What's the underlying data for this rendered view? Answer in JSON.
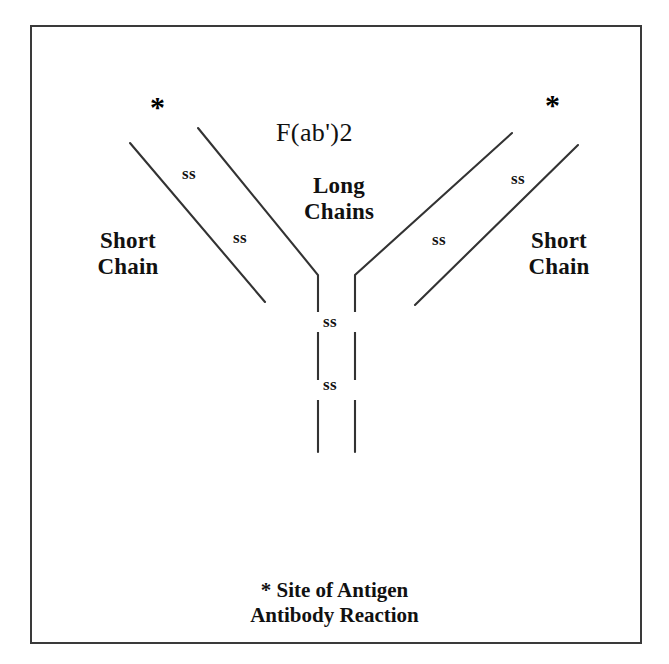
{
  "diagram": {
    "type": "antibody-structure",
    "title": "F(ab')2",
    "frame": {
      "border_color": "#3a3a3a",
      "background": "#ffffff"
    },
    "ink_color": "#333333",
    "labels": {
      "fab2": "F(ab')2",
      "long_chains": "Long\nChains",
      "short_chain_left": "Short\nChain",
      "short_chain_right": "Short\nChain",
      "ss_left_upper": "ss",
      "ss_left_lower": "ss",
      "ss_right_upper": "ss",
      "ss_right_lower": "ss",
      "ss_stem_upper": "ss",
      "ss_stem_lower": "ss",
      "asterisk_left": "*",
      "asterisk_right": "*",
      "caption": "* Site of Antigen\nAntibody Reaction"
    },
    "chain_lines": [
      {
        "name": "short-chain-left",
        "points": "130,143 265,302"
      },
      {
        "name": "long-chain-left",
        "points": "198,128 318,275 318,452"
      },
      {
        "name": "long-chain-right",
        "points": "512,133 355,275 355,452"
      },
      {
        "name": "short-chain-right",
        "points": "578,145 415,305"
      }
    ],
    "disulfide_gaps": [
      {
        "name": "gap-left-stem-upper",
        "x": 318,
        "y": 322,
        "h": 20
      },
      {
        "name": "gap-right-stem-upper",
        "x": 355,
        "y": 322,
        "h": 20
      },
      {
        "name": "gap-left-stem-lower",
        "x": 318,
        "y": 390,
        "h": 20
      },
      {
        "name": "gap-right-stem-lower",
        "x": 355,
        "y": 390,
        "h": 20
      }
    ]
  }
}
